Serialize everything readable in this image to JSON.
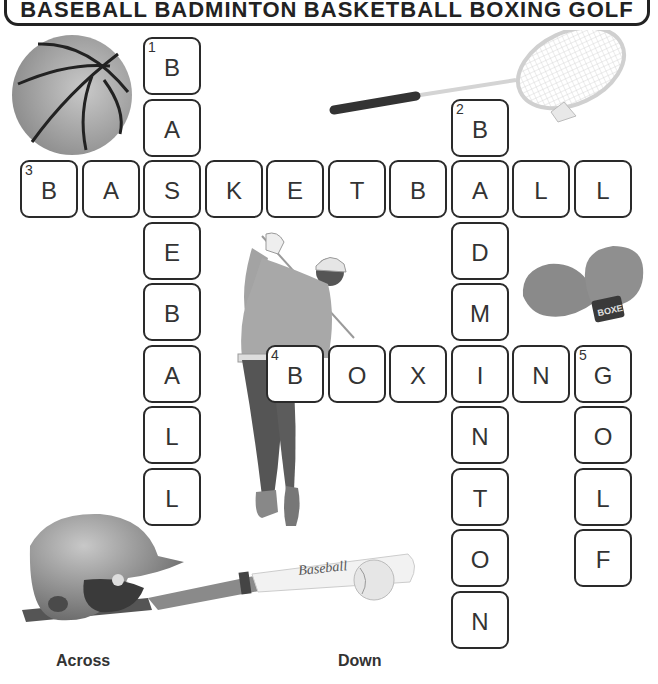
{
  "word_bank": [
    "BASEBALL",
    "BADMINTON",
    "BASKETBALL",
    "BOXING",
    "GOLF"
  ],
  "clue_labels": {
    "across": "Across",
    "down": "Down"
  },
  "grid": {
    "cell_pitch_x": 61.5,
    "cell_pitch_y": 61.5,
    "origin_x": 20,
    "origin_y": 37,
    "cells": [
      {
        "row": 0,
        "col": 2,
        "letter": "B",
        "number": "1"
      },
      {
        "row": 1,
        "col": 2,
        "letter": "A"
      },
      {
        "row": 2,
        "col": 0,
        "letter": "B",
        "number": "3"
      },
      {
        "row": 2,
        "col": 1,
        "letter": "A"
      },
      {
        "row": 2,
        "col": 2,
        "letter": "S"
      },
      {
        "row": 2,
        "col": 3,
        "letter": "K"
      },
      {
        "row": 2,
        "col": 4,
        "letter": "E"
      },
      {
        "row": 2,
        "col": 5,
        "letter": "T"
      },
      {
        "row": 2,
        "col": 6,
        "letter": "B"
      },
      {
        "row": 2,
        "col": 7,
        "letter": "A"
      },
      {
        "row": 2,
        "col": 8,
        "letter": "L"
      },
      {
        "row": 2,
        "col": 9,
        "letter": "L"
      },
      {
        "row": 1,
        "col": 7,
        "letter": "B",
        "number": "2"
      },
      {
        "row": 3,
        "col": 2,
        "letter": "E"
      },
      {
        "row": 4,
        "col": 2,
        "letter": "B"
      },
      {
        "row": 5,
        "col": 2,
        "letter": "A"
      },
      {
        "row": 6,
        "col": 2,
        "letter": "L"
      },
      {
        "row": 7,
        "col": 2,
        "letter": "L"
      },
      {
        "row": 3,
        "col": 7,
        "letter": "D"
      },
      {
        "row": 4,
        "col": 7,
        "letter": "M"
      },
      {
        "row": 5,
        "col": 4,
        "letter": "B",
        "number": "4"
      },
      {
        "row": 5,
        "col": 5,
        "letter": "O"
      },
      {
        "row": 5,
        "col": 6,
        "letter": "X"
      },
      {
        "row": 5,
        "col": 7,
        "letter": "I"
      },
      {
        "row": 5,
        "col": 8,
        "letter": "N"
      },
      {
        "row": 5,
        "col": 9,
        "letter": "G",
        "number": "5"
      },
      {
        "row": 6,
        "col": 7,
        "letter": "N"
      },
      {
        "row": 7,
        "col": 7,
        "letter": "T"
      },
      {
        "row": 8,
        "col": 7,
        "letter": "O"
      },
      {
        "row": 9,
        "col": 7,
        "letter": "N"
      },
      {
        "row": 6,
        "col": 9,
        "letter": "O"
      },
      {
        "row": 7,
        "col": 9,
        "letter": "L"
      },
      {
        "row": 8,
        "col": 9,
        "letter": "F"
      }
    ]
  },
  "words": {
    "across": [
      {
        "number": "3",
        "answer": "BASKETBALL"
      },
      {
        "number": "4",
        "answer": "BOXING"
      }
    ],
    "down": [
      {
        "number": "1",
        "answer": "BASEBALL"
      },
      {
        "number": "2",
        "answer": "BADMINTON"
      },
      {
        "number": "5",
        "answer": "GOLF"
      }
    ]
  },
  "images": {
    "basketball": "basketball-icon",
    "badminton_racket": "badminton-racket-icon",
    "boxing_gloves": "boxing-gloves-icon",
    "boxing_glove_text": "BOXE",
    "golfer": "golfer-icon",
    "baseball_set": "baseball-helmet-bat-ball-icon",
    "bat_text": "Baseball"
  }
}
